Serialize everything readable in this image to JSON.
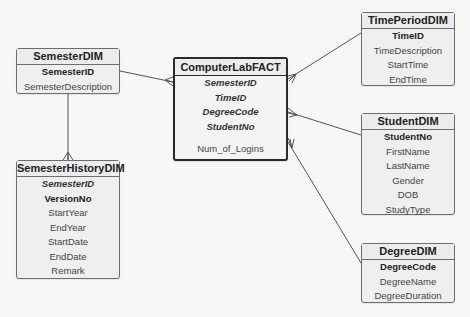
{
  "diagram": {
    "type": "star-schema-erd",
    "fact": {
      "name": "ComputerLabFACT",
      "foreign_keys": [
        "SemesterID",
        "TimeID",
        "DegreeCode",
        "StudentNo"
      ],
      "measures": [
        "Num_of_Logins"
      ]
    },
    "dimensions": {
      "semester": {
        "name": "SemesterDIM",
        "primary_keys": [
          "SemesterID"
        ],
        "attributes": [
          "SemesterDescription"
        ]
      },
      "semester_history": {
        "name": "SemesterHistoryDIM",
        "foreign_keys": [
          "SemesterID"
        ],
        "primary_keys": [
          "VersionNo"
        ],
        "attributes": [
          "StartYear",
          "EndYear",
          "StartDate",
          "EndDate",
          "Remark"
        ]
      },
      "time_period": {
        "name": "TimePeriodDIM",
        "primary_keys": [
          "TimeID"
        ],
        "attributes": [
          "TimeDescription",
          "StartTime",
          "EndTime"
        ]
      },
      "student": {
        "name": "StudentDIM",
        "primary_keys": [
          "StudentNo"
        ],
        "attributes": [
          "FirstName",
          "LastName",
          "Gender",
          "DOB",
          "StudyType"
        ]
      },
      "degree": {
        "name": "DegreeDIM",
        "primary_keys": [
          "DegreeCode"
        ],
        "attributes": [
          "DegreeName",
          "DegreeDuration"
        ]
      }
    },
    "relationships": [
      {
        "from": "SemesterDIM",
        "to": "ComputerLabFACT",
        "cardinality": "one-to-many"
      },
      {
        "from": "TimePeriodDIM",
        "to": "ComputerLabFACT",
        "cardinality": "one-to-many"
      },
      {
        "from": "StudentDIM",
        "to": "ComputerLabFACT",
        "cardinality": "one-to-many"
      },
      {
        "from": "DegreeDIM",
        "to": "ComputerLabFACT",
        "cardinality": "one-to-many"
      },
      {
        "from": "SemesterDIM",
        "to": "SemesterHistoryDIM",
        "cardinality": "one-to-many"
      }
    ],
    "colors": {
      "line": "#555555",
      "box_border": "#6d6d6d",
      "fact_border": "#2a2a2a",
      "box_fill": "#efefef"
    }
  }
}
